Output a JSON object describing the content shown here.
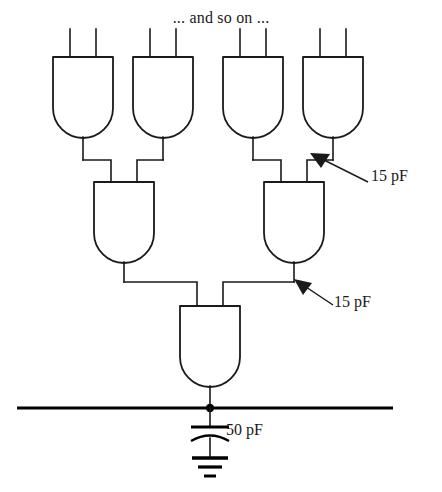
{
  "figure": {
    "kind": "logic-gate-tree-schematic",
    "top_note": "... and so on ...",
    "annotations": {
      "upper_branch_capacitance": "15 pF",
      "mid_branch_capacitance": "15 pF",
      "bus_capacitance": "50 pF"
    },
    "symbols": {
      "gate_type": "and-gate",
      "capacitor": "capacitor-symbol",
      "ground": "ground-symbol",
      "junction": "junction-dot",
      "bus": "horizontal-bus-line"
    },
    "levels": [
      {
        "name": "input-gate-row",
        "gate_count": 4,
        "inputs_per_gate": 2
      },
      {
        "name": "second-stage-row",
        "gate_count": 2,
        "inputs_per_gate": 2
      },
      {
        "name": "output-gate-row",
        "gate_count": 1,
        "inputs_per_gate": 2
      }
    ]
  }
}
